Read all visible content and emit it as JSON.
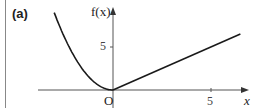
{
  "panel_label": "(a)",
  "chart_data": {
    "type": "line",
    "title": "(a)",
    "xlabel": "x",
    "ylabel": "f(x)",
    "origin_label": "O",
    "x_ticks": [
      5
    ],
    "y_ticks": [
      5
    ],
    "x_tick_labels": [
      "5"
    ],
    "y_tick_labels": [
      "5"
    ],
    "xlim": [
      -4.5,
      7
    ],
    "ylim": [
      -2,
      10
    ],
    "grid": false,
    "legend": null,
    "series": [
      {
        "name": "f(x) = x^2, x < 0",
        "x": [
          -3,
          -2.5,
          -2,
          -1.5,
          -1,
          -0.5,
          0
        ],
        "y": [
          9,
          6.25,
          4,
          2.25,
          1,
          0.25,
          0
        ]
      },
      {
        "name": "f(x) = x, x >= 0",
        "x": [
          0,
          6.5
        ],
        "y": [
          0,
          6.5
        ]
      }
    ]
  }
}
